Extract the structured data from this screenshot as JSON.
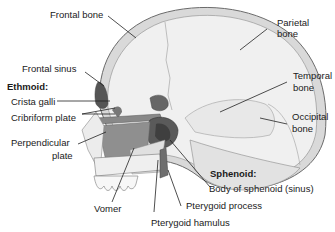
{
  "diagram": {
    "colors": {
      "bone_fill": "#ececec",
      "bone_outline": "#6b6b6b",
      "shaded_bone": "#8f8f8f",
      "dark_bone": "#555555",
      "leader_line": "#222222",
      "text": "#1a1a1a"
    },
    "labels": {
      "frontal_bone": "Frontal bone",
      "parietal_bone_1": "Parietal",
      "parietal_bone_2": "bone",
      "frontal_sinus": "Frontal sinus",
      "ethmoid_heading": "Ethmoid:",
      "crista_galli": "Crista galli",
      "cribriform_plate": "Cribriform plate",
      "perpendicular_plate_1": "Perpendicular",
      "perpendicular_plate_2": "plate",
      "temporal_bone_1": "Temporal",
      "temporal_bone_2": "bone",
      "occipital_bone_1": "Occipital",
      "occipital_bone_2": "bone",
      "sphenoid_heading": "Sphenoid:",
      "body_of_sphenoid": "Body of sphenoid (sinus)",
      "pterygoid_process": "Pterygoid process",
      "pterygoid_hamulus": "Pterygoid hamulus",
      "vomer": "Vomer"
    }
  }
}
